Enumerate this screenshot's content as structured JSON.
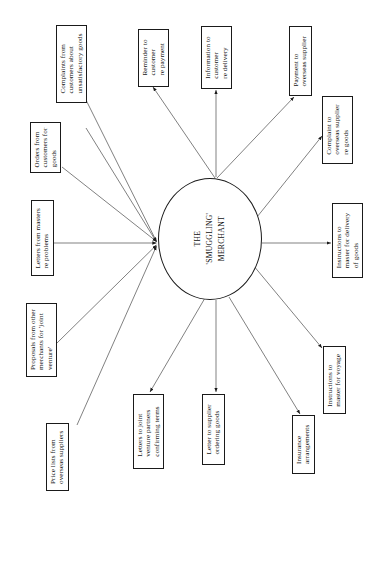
{
  "diagram": {
    "type": "hub-and-spoke communication diagram",
    "orientation": "rotated-90",
    "center": {
      "label": "THE\n'SMUGGLING'\nMERCHANT",
      "shape": "ellipse"
    },
    "colors": {
      "stroke": "#1a1a1a",
      "background": "#ffffff",
      "text": "#111111"
    },
    "inbound": [
      {
        "id": "complaints-from-customers",
        "label": "Complaints from\ncustomers about\nunsatisfactory goods"
      },
      {
        "id": "orders-from-customers",
        "label": "Orders from\ncustomers for\ngoods"
      },
      {
        "id": "letters-from-masters",
        "label": "Letters from masters\nre problems"
      },
      {
        "id": "proposals-from-other-merchants",
        "label": "Proposals from other\nmerchants for 'joint\nventure'"
      },
      {
        "id": "price-lists-from-overseas-suppliers",
        "label": "Price lists from\noverseas suppliers"
      }
    ],
    "outbound": [
      {
        "id": "reminder-to-customer",
        "label": "Reminder to\ncustomer\nre payment"
      },
      {
        "id": "information-to-customer",
        "label": "Information to\ncustomer\nre delivery"
      },
      {
        "id": "payment-to-overseas-supplier",
        "label": "Payment to\noverseas supplier"
      },
      {
        "id": "complaint-to-overseas-supplier",
        "label": "Complaint to\noverseas supplier\nre goods"
      },
      {
        "id": "instructions-to-master-delivery",
        "label": "Instructions to\nmaster for delivery\nof goods"
      },
      {
        "id": "instructions-to-master-voyage",
        "label": "Instructions to\nmaster for voyage"
      },
      {
        "id": "insurance-arrangements",
        "label": "Insurance\narrangements"
      },
      {
        "id": "letter-to-supplier-ordering-goods",
        "label": "Letter to supplier\nordering goods"
      },
      {
        "id": "letters-to-joint-venture-partners",
        "label": "Letters to joint\nventure partners\nconfirming terms"
      }
    ]
  }
}
